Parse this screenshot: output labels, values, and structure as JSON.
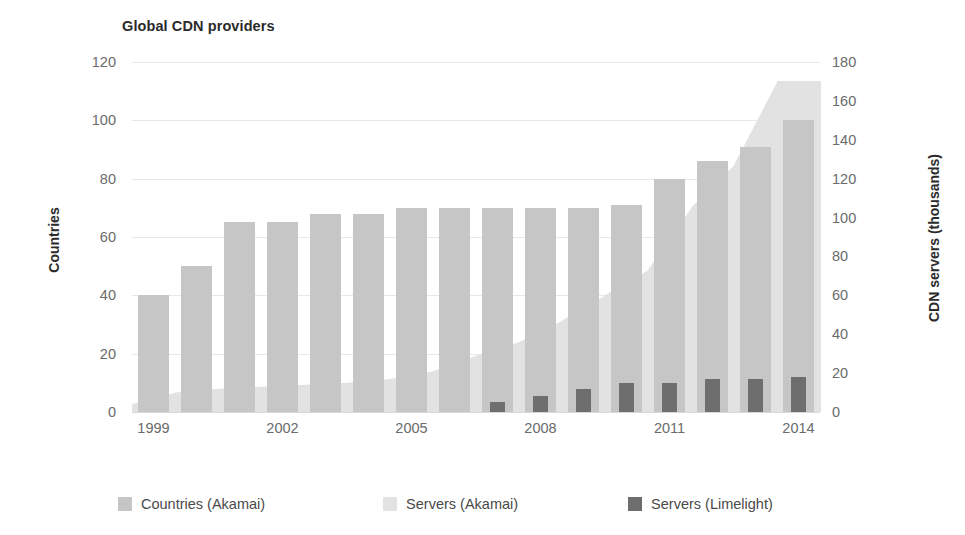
{
  "chart_data": {
    "type": "bar",
    "title": "Global CDN providers",
    "xlabel": "",
    "ylabel": "Countries",
    "y2label": "CDN servers (thousands)",
    "grid": true,
    "legend_position": "bottom",
    "ylim": [
      0,
      120
    ],
    "y2lim": [
      0,
      180
    ],
    "yticks": [
      "0",
      "20",
      "40",
      "60",
      "80",
      "100",
      "120"
    ],
    "y2ticks": [
      "0",
      "20",
      "40",
      "60",
      "80",
      "100",
      "120",
      "140",
      "160",
      "180"
    ],
    "x": [
      1999,
      2000,
      2001,
      2002,
      2003,
      2004,
      2005,
      2006,
      2007,
      2008,
      2009,
      2010,
      2011,
      2012,
      2013,
      2014
    ],
    "xticks": [
      "1999",
      "2002",
      "2005",
      "2008",
      "2011",
      "2014"
    ],
    "xtick_values": [
      1999,
      2002,
      2005,
      2008,
      2011,
      2014
    ],
    "series": [
      {
        "name": "Countries (Akamai)",
        "axis": "left",
        "color": "#c6c6c6",
        "values": [
          40,
          50,
          65,
          65,
          68,
          68,
          70,
          70,
          70,
          70,
          70,
          71,
          80,
          86,
          91,
          100
        ]
      },
      {
        "name": "Servers (Akamai)",
        "axis": "right",
        "color": "#e2e2e2",
        "values": [
          4,
          10,
          12,
          13,
          14,
          15,
          17,
          21,
          29,
          36,
          47,
          60,
          73,
          105,
          127,
          170
        ]
      },
      {
        "name": "Servers (Limelight)",
        "axis": "right",
        "color": "#6e6e6e",
        "values": [
          0,
          0,
          0,
          0,
          0,
          0,
          0,
          0,
          5,
          8,
          12,
          15,
          15,
          17,
          17,
          18
        ]
      }
    ]
  }
}
